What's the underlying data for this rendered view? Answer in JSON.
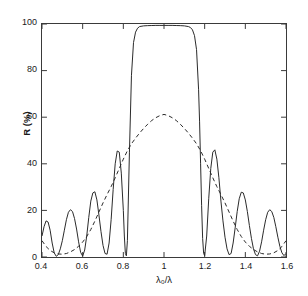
{
  "chart_data": {
    "type": "line",
    "title": "",
    "xlabel": "λ₀/λ",
    "ylabel": "R (%)",
    "xlim": [
      0.4,
      1.6
    ],
    "ylim": [
      0,
      100
    ],
    "grid": false,
    "legend_position": "none",
    "xticks": [
      0.4,
      0.6,
      0.8,
      1.0,
      1.2,
      1.4,
      1.6
    ],
    "xticklabels": [
      "0.4",
      "0.6",
      "0.8",
      "1",
      "1.2",
      "1.4",
      "1.6"
    ],
    "yticks": [
      0,
      20,
      40,
      60,
      80,
      100
    ],
    "yticklabels": [
      "0",
      "20",
      "40",
      "60",
      "80",
      "100"
    ],
    "series": [
      {
        "name": "solid",
        "style": "solid",
        "color": "#2b2b2b",
        "x": [
          0.4,
          0.41,
          0.42,
          0.43,
          0.44,
          0.45,
          0.46,
          0.47,
          0.48,
          0.49,
          0.5,
          0.51,
          0.52,
          0.53,
          0.54,
          0.55,
          0.56,
          0.57,
          0.58,
          0.59,
          0.6,
          0.61,
          0.62,
          0.63,
          0.64,
          0.65,
          0.66,
          0.67,
          0.68,
          0.69,
          0.7,
          0.71,
          0.72,
          0.73,
          0.74,
          0.75,
          0.76,
          0.77,
          0.78,
          0.79,
          0.8,
          0.805,
          0.81,
          0.815,
          0.82,
          0.83,
          0.84,
          0.85,
          0.86,
          0.87,
          0.88,
          0.9,
          0.92,
          0.94,
          0.96,
          0.98,
          1.0,
          1.02,
          1.04,
          1.06,
          1.08,
          1.1,
          1.12,
          1.13,
          1.14,
          1.15,
          1.16,
          1.17,
          1.175,
          1.18,
          1.185,
          1.19,
          1.195,
          1.2,
          1.21,
          1.22,
          1.23,
          1.24,
          1.25,
          1.26,
          1.27,
          1.28,
          1.29,
          1.3,
          1.31,
          1.32,
          1.33,
          1.34,
          1.35,
          1.36,
          1.37,
          1.38,
          1.39,
          1.4,
          1.41,
          1.42,
          1.43,
          1.44,
          1.45,
          1.46,
          1.47,
          1.48,
          1.49,
          1.5,
          1.51,
          1.52,
          1.53,
          1.54,
          1.55,
          1.56,
          1.57,
          1.58,
          1.59,
          1.6
        ],
        "y": [
          9.0,
          13.0,
          15.5,
          15.0,
          11.5,
          6.0,
          1.8,
          0.3,
          1.0,
          3.5,
          7.0,
          11.5,
          16.0,
          19.2,
          20.3,
          19.5,
          16.5,
          12.0,
          6.5,
          2.0,
          0.4,
          3.0,
          9.0,
          17.0,
          24.0,
          27.5,
          28.0,
          24.5,
          18.0,
          11.0,
          5.0,
          1.5,
          1.2,
          6.0,
          16.0,
          29.0,
          40.0,
          45.5,
          45.0,
          36.0,
          20.0,
          9.0,
          1.5,
          0.5,
          7.0,
          45.0,
          78.0,
          92.0,
          96.5,
          98.2,
          98.9,
          99.2,
          99.3,
          99.35,
          99.4,
          99.4,
          99.4,
          99.4,
          99.4,
          99.35,
          99.3,
          99.2,
          98.9,
          98.5,
          97.5,
          95.0,
          89.0,
          72.0,
          58.0,
          40.0,
          22.0,
          8.0,
          1.5,
          0.6,
          9.0,
          25.0,
          38.0,
          45.0,
          46.0,
          42.0,
          34.0,
          24.0,
          15.5,
          8.5,
          3.5,
          1.0,
          1.5,
          6.0,
          12.5,
          19.5,
          25.0,
          27.8,
          27.5,
          24.5,
          19.5,
          13.5,
          8.0,
          3.5,
          1.0,
          0.5,
          2.5,
          6.5,
          11.5,
          16.0,
          19.2,
          20.3,
          19.5,
          17.0,
          13.0,
          8.5,
          4.5,
          1.8,
          0.6,
          1.5
        ]
      },
      {
        "name": "dashed-envelope",
        "style": "dashed",
        "color": "#2b2b2b",
        "x": [
          0.4,
          0.42,
          0.44,
          0.46,
          0.48,
          0.5,
          0.52,
          0.54,
          0.56,
          0.58,
          0.6,
          0.62,
          0.64,
          0.66,
          0.68,
          0.7,
          0.72,
          0.74,
          0.76,
          0.78,
          0.8,
          0.82,
          0.84,
          0.86,
          0.88,
          0.9,
          0.92,
          0.94,
          0.96,
          0.98,
          1.0,
          1.02,
          1.04,
          1.06,
          1.08,
          1.1,
          1.12,
          1.14,
          1.16,
          1.18,
          1.2,
          1.22,
          1.24,
          1.26,
          1.28,
          1.3,
          1.32,
          1.34,
          1.36,
          1.38,
          1.4,
          1.42,
          1.44,
          1.46,
          1.48,
          1.5,
          1.52,
          1.54,
          1.56,
          1.58,
          1.6
        ],
        "y": [
          7.0,
          4.5,
          2.8,
          1.8,
          1.3,
          1.2,
          1.5,
          2.2,
          3.2,
          4.6,
          6.4,
          8.8,
          11.8,
          15.4,
          19.3,
          23.2,
          26.8,
          30.2,
          34.0,
          38.0,
          42.0,
          45.6,
          48.6,
          51.0,
          53.2,
          55.2,
          57.0,
          58.6,
          59.8,
          60.7,
          61.2,
          60.7,
          59.8,
          58.6,
          57.0,
          55.2,
          53.2,
          51.0,
          48.6,
          45.6,
          42.0,
          38.0,
          34.0,
          30.2,
          26.8,
          23.2,
          19.3,
          15.4,
          11.8,
          8.8,
          6.4,
          4.6,
          3.2,
          2.2,
          1.5,
          1.2,
          1.3,
          1.8,
          2.8,
          4.5,
          7.0
        ]
      }
    ]
  },
  "axes": {
    "xlabel": "λ₀/λ",
    "ylabel": "R (%)"
  }
}
